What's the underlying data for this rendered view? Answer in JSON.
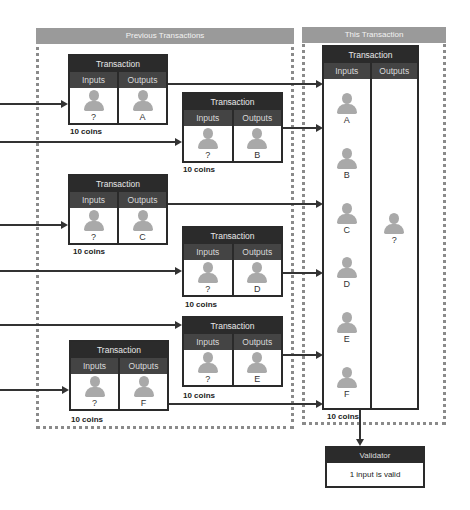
{
  "panels": {
    "previous": {
      "title": "Previous Transactions"
    },
    "current": {
      "title": "This Transaction"
    }
  },
  "labels": {
    "transaction": "Transaction",
    "inputs": "Inputs",
    "outputs": "Outputs"
  },
  "previous_transactions": [
    {
      "id": "A",
      "input": "?",
      "output": "A",
      "amount": "10 coins"
    },
    {
      "id": "B",
      "input": "?",
      "output": "B",
      "amount": "10 coins"
    },
    {
      "id": "C",
      "input": "?",
      "output": "C",
      "amount": "10 coins"
    },
    {
      "id": "D",
      "input": "?",
      "output": "D",
      "amount": "10 coins"
    },
    {
      "id": "E",
      "input": "?",
      "output": "E",
      "amount": "10 coins"
    },
    {
      "id": "F",
      "input": "?",
      "output": "F",
      "amount": "10 coins"
    }
  ],
  "this_transaction": {
    "inputs": [
      "A",
      "B",
      "C",
      "D",
      "E",
      "F"
    ],
    "output": "?",
    "amount": "10 coins"
  },
  "validator": {
    "title": "Validator",
    "result": "1 input is valid"
  },
  "colors": {
    "panel_header": "#9a9a9a",
    "tx_header": "#2b2b2b",
    "tx_subheader": "#444444",
    "person_icon": "#a9a9a9",
    "line": "#333333"
  }
}
